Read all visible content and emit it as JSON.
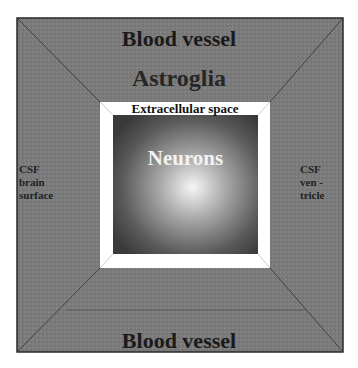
{
  "diagram": {
    "outer_region": {
      "top_label": "Blood vessel",
      "bottom_label": "Blood vessel"
    },
    "glia_label": "Astroglia",
    "extracellular_label": "Extracellular space",
    "core_label": "Neurons",
    "left_label": {
      "line1": "CSF",
      "line2": "brain",
      "line3": "surface"
    },
    "right_label": {
      "line1": "CSF",
      "line2": "ven -",
      "line3": "tricle"
    },
    "colors": {
      "outer_fill": "#7a7a7a",
      "outer_border": "#2a2a2a",
      "frame_fill": "#ffffff",
      "core_edge": "#3c3c3c",
      "core_center": "#f4f4f4"
    }
  }
}
